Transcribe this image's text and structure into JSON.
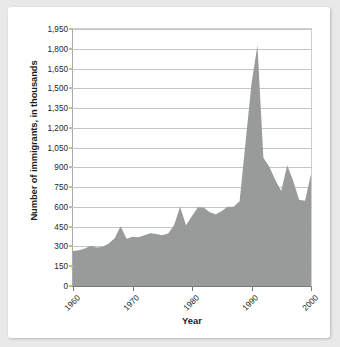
{
  "figure": {
    "background_color": "#e9e9e9",
    "card_color": "#ffffff",
    "area_fill_color": "#999a9a",
    "gridline_color": "#c5c5c5"
  },
  "chart_data": {
    "type": "area",
    "title": "",
    "xlabel": "Year",
    "ylabel": "Number of immigrants, in thousands",
    "xlim": [
      1960,
      2000
    ],
    "ylim": [
      0,
      1950
    ],
    "grid": true,
    "legend": false,
    "yticks": [
      0,
      150,
      300,
      450,
      600,
      750,
      900,
      1050,
      1200,
      1350,
      1500,
      1650,
      1800,
      1950
    ],
    "ytick_labels": [
      "0",
      "150",
      "300",
      "450",
      "600",
      "750",
      "900",
      "1,050",
      "1,200",
      "1,350",
      "1,500",
      "1,650",
      "1,800",
      "1,950"
    ],
    "xticks": [
      1960,
      1970,
      1980,
      1990,
      2000
    ],
    "xtick_labels": [
      "1960",
      "1970",
      "1980",
      "1990",
      "2000"
    ],
    "x": [
      1960,
      1961,
      1962,
      1963,
      1964,
      1965,
      1966,
      1967,
      1968,
      1969,
      1970,
      1971,
      1972,
      1973,
      1974,
      1975,
      1976,
      1977,
      1978,
      1979,
      1980,
      1981,
      1982,
      1983,
      1984,
      1985,
      1986,
      1987,
      1988,
      1989,
      1990,
      1991,
      1992,
      1993,
      1994,
      1995,
      1996,
      1997,
      1998,
      1999,
      2000
    ],
    "values": [
      265,
      271,
      284,
      306,
      292,
      297,
      323,
      362,
      454,
      359,
      373,
      370,
      385,
      400,
      395,
      386,
      399,
      462,
      601,
      460,
      531,
      597,
      594,
      560,
      544,
      570,
      602,
      602,
      643,
      1091,
      1536,
      1827,
      974,
      904,
      804,
      720,
      916,
      798,
      654,
      647,
      850
    ],
    "source_note": "",
    "value_units": "thousands"
  }
}
